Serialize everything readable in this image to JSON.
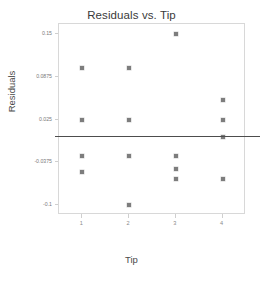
{
  "chart_data": {
    "type": "scatter",
    "title": "Residuals vs. Tip",
    "xlabel": "Tip",
    "ylabel": "Residuals",
    "grid": false,
    "legend": null,
    "xlim": [
      0.5,
      4.5
    ],
    "ylim": [
      -0.115,
      0.165
    ],
    "xticks": [
      1,
      2,
      3,
      4
    ],
    "xtick_labels": [
      "1",
      "2",
      "3",
      "4"
    ],
    "yticks": [
      0.15,
      0.0875,
      0.025,
      -0.0375,
      -0.1
    ],
    "ytick_labels": [
      "0.15",
      "0.0875",
      "0.025",
      "-0.0375",
      "-0.1"
    ],
    "reference_line": {
      "orientation": "horizontal",
      "y": 0.0,
      "color": "#4d4d4d"
    },
    "marker": {
      "shape": "square",
      "color": "#7d7d7d",
      "size": 4
    },
    "x": [
      1,
      1,
      1,
      1,
      2,
      2,
      2,
      2,
      3,
      3,
      3,
      3,
      4,
      4,
      4,
      4
    ],
    "y": [
      0.1,
      0.025,
      -0.028,
      -0.052,
      0.1,
      0.025,
      -0.028,
      -0.1,
      0.15,
      -0.028,
      -0.047,
      -0.062,
      0.053,
      0.025,
      0.0,
      -0.062
    ],
    "points": [
      {
        "x": 1,
        "y": 0.1
      },
      {
        "x": 1,
        "y": 0.025
      },
      {
        "x": 1,
        "y": -0.028
      },
      {
        "x": 1,
        "y": -0.052
      },
      {
        "x": 2,
        "y": 0.1
      },
      {
        "x": 2,
        "y": 0.025
      },
      {
        "x": 2,
        "y": -0.028
      },
      {
        "x": 2,
        "y": -0.1
      },
      {
        "x": 3,
        "y": 0.15
      },
      {
        "x": 3,
        "y": -0.028
      },
      {
        "x": 3,
        "y": -0.047
      },
      {
        "x": 3,
        "y": -0.062
      },
      {
        "x": 4,
        "y": 0.053
      },
      {
        "x": 4,
        "y": 0.025
      },
      {
        "x": 4,
        "y": 0.0
      },
      {
        "x": 4,
        "y": -0.062
      }
    ]
  }
}
